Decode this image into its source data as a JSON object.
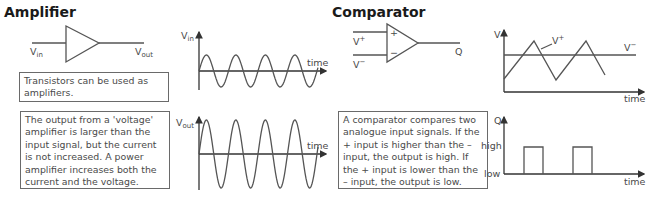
{
  "amplifier": {
    "title": "Amplifier",
    "symbol": {
      "input_label": "V",
      "input_sub": "in",
      "output_label": "V",
      "output_sub": "out"
    },
    "note_box": "Transistors can be used as amplifiers.",
    "description_box": "The output from a 'voltage' amplifier is larger than the input signal, but the current is not increased. A power amplifier increases both the current and the voltage.",
    "input_graph": {
      "y_label": "V",
      "y_sub": "in",
      "x_label": "time"
    },
    "output_graph": {
      "y_label": "V",
      "y_sub": "out",
      "x_label": "time"
    }
  },
  "comparator": {
    "title": "Comparator",
    "symbol": {
      "plus_sign": "+",
      "minus_sign": "−",
      "vplus_label": "V",
      "vplus_sup": "+",
      "vminus_label": "V",
      "vminus_sup": "−",
      "output_label": "Q"
    },
    "description_box": "A comparator compares two analogue input signals. If the + input is higher than the – input, the output is high. If the + input is lower than the – input, the output is low.",
    "input_graph": {
      "y_label": "V",
      "x_label": "time",
      "vplus_label": "V",
      "vplus_sup": "+",
      "vminus_label": "V",
      "vminus_sup": "−"
    },
    "output_graph": {
      "y_label": "Q",
      "x_label": "time",
      "high_label": "high",
      "low_label": "low"
    }
  },
  "colors": {
    "line": "#555555",
    "text": "#4a4a4a",
    "title": "#1a1a1a",
    "box_border": "#6a6a6a"
  }
}
